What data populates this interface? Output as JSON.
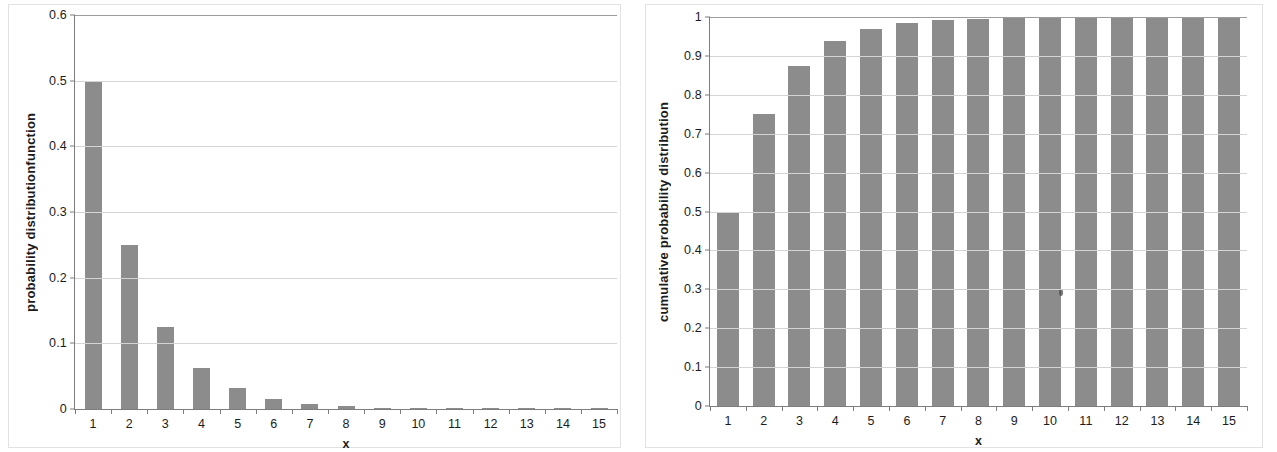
{
  "chart_data": [
    {
      "type": "bar",
      "panel": "left",
      "title": "",
      "xlabel": "x",
      "ylabel": "probability distributionfunction",
      "categories": [
        "1",
        "2",
        "3",
        "4",
        "5",
        "6",
        "7",
        "8",
        "9",
        "10",
        "11",
        "12",
        "13",
        "14",
        "15"
      ],
      "values": [
        0.5,
        0.25,
        0.125,
        0.0625,
        0.03125,
        0.015625,
        0.0078125,
        0.00390625,
        0.001953125,
        0.0009765625,
        0.00048828125,
        0.000244140625,
        0.0001220703125,
        6.103515625e-05,
        3.0517578125e-05
      ],
      "ylim": [
        0,
        0.6
      ],
      "yticks": [
        "0",
        "0.1",
        "0.2",
        "0.3",
        "0.4",
        "0.5",
        "0.6"
      ],
      "ytick_values": [
        0,
        0.1,
        0.2,
        0.3,
        0.4,
        0.5,
        0.6
      ],
      "grid": true,
      "legend": "none",
      "bar_color": "#8c8c8c"
    },
    {
      "type": "bar",
      "panel": "right",
      "title": "",
      "xlabel": "x",
      "ylabel": "cumulative probability distribution",
      "categories": [
        "1",
        "2",
        "3",
        "4",
        "5",
        "6",
        "7",
        "8",
        "9",
        "10",
        "11",
        "12",
        "13",
        "14",
        "15"
      ],
      "values": [
        0.5,
        0.75,
        0.875,
        0.9375,
        0.96875,
        0.984375,
        0.9921875,
        0.99609375,
        0.998046875,
        0.9990234375,
        0.99951171875,
        0.999755859375,
        0.9998779296875,
        0.99993896484375,
        0.999969482421875
      ],
      "ylim": [
        0,
        1
      ],
      "yticks": [
        "0",
        "0.1",
        "0.2",
        "0.3",
        "0.4",
        "0.5",
        "0.6",
        "0.7",
        "0.8",
        "0.9",
        "1"
      ],
      "ytick_values": [
        0,
        0.1,
        0.2,
        0.3,
        0.4,
        0.5,
        0.6,
        0.7,
        0.8,
        0.9,
        1
      ],
      "grid": true,
      "legend": "none",
      "bar_color": "#8c8c8c"
    }
  ]
}
